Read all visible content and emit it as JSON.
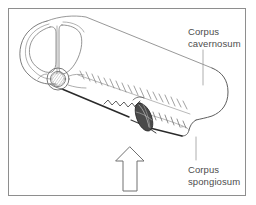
{
  "figure": {
    "kind": "anatomical-line-drawing",
    "frame": {
      "border_color": "#8e8e8e",
      "background_color": "#ffffff"
    },
    "labels": {
      "cavernosum": {
        "line1": "Corpus",
        "line2": "cavernosum",
        "leader": "vertical-line-down-to-shaft"
      },
      "spongiosum": {
        "line1": "Corpus",
        "line2": "spongiosum",
        "leader": "vertical-line-up-to-shaft"
      }
    },
    "annotations": {
      "arrow": {
        "name": "upward-pointing-arrow",
        "direction": "up",
        "style": "outline",
        "target": "graft-site"
      }
    },
    "parts": [
      {
        "name": "corpus-cavernosum-left-oval"
      },
      {
        "name": "corpus-cavernosum-right-oval"
      },
      {
        "name": "tunica-albuginea-outline"
      },
      {
        "name": "urethra-cross-section"
      },
      {
        "name": "corpus-spongiosum-body"
      },
      {
        "name": "suture-line-superior"
      },
      {
        "name": "suture-line-inferior"
      },
      {
        "name": "graft-patch"
      },
      {
        "name": "shaft-distal-rounded-end"
      }
    ],
    "colors": {
      "ink": "#3c3c3c",
      "ink_light": "#8a8a8a",
      "ink_dark": "#1a1a1a",
      "label_text": "#4d4d4d",
      "hatch": "#9a9a9a"
    }
  }
}
